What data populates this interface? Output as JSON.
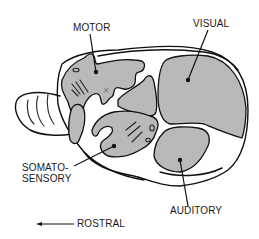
{
  "figure": {
    "colors": {
      "region_fill": "#b9b9b9",
      "outline": "#111111",
      "background": "#ffffff",
      "marker_x": "#7a7a7a"
    }
  },
  "labels": {
    "motor": "MOTOR",
    "visual": "VISUAL",
    "somatosensory_line1": "SOMATO-",
    "somatosensory_line2": "SENSORY",
    "auditory": "AUDITORY",
    "rostral": "ROSTRAL"
  },
  "regions": [
    {
      "name": "motor",
      "label": "MOTOR"
    },
    {
      "name": "somatosensory",
      "label": "SOMATO-SENSORY"
    },
    {
      "name": "visual",
      "label": "VISUAL"
    },
    {
      "name": "auditory",
      "label": "AUDITORY"
    }
  ],
  "orientation": {
    "arrow_direction": "left",
    "label": "ROSTRAL"
  },
  "markers": {
    "x_mark": "×"
  }
}
